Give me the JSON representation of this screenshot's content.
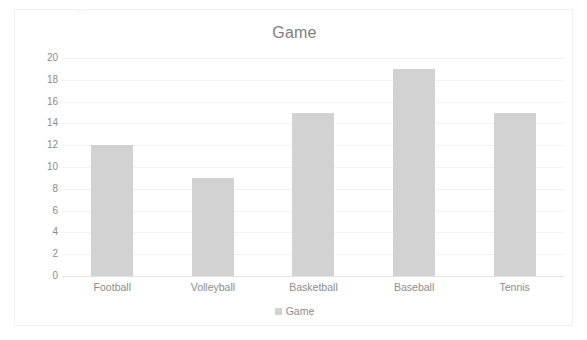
{
  "chart_data": {
    "type": "bar",
    "title": "Game",
    "xlabel": "",
    "ylabel": "",
    "categories": [
      "Football",
      "Volleyball",
      "Basketball",
      "Baseball",
      "Tennis"
    ],
    "values": [
      12,
      9,
      15,
      19,
      15
    ],
    "series": [
      {
        "name": "Game",
        "values": [
          12,
          9,
          15,
          19,
          15
        ]
      }
    ],
    "ylim": [
      0,
      20
    ],
    "ytick_step": 2,
    "yticks": [
      20,
      18,
      16,
      14,
      12,
      10,
      8,
      6,
      4,
      2,
      0
    ],
    "ytick_labels": [
      "20",
      "18",
      "16",
      "14",
      "12",
      "10",
      "8",
      "6",
      "4",
      "2",
      "0"
    ],
    "grid": "horizontal",
    "legend_position": "bottom",
    "legend": [
      {
        "label": "Game",
        "color": "#d2d2d2",
        "marker": "square-swatch"
      }
    ],
    "colors": {
      "bar": "#d2d2d2",
      "title_text": "#7f7f7f",
      "axis_text": "#8c8c8c",
      "gridline": "#f2f2f2",
      "baseline": "#e4e4e4",
      "plot_background": "#ffffff",
      "chart_border": "#f0f0f0"
    }
  }
}
